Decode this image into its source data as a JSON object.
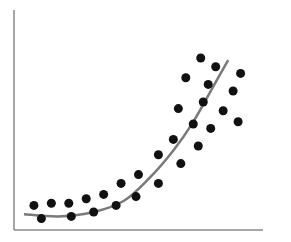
{
  "chart_data": {
    "type": "scatter",
    "title": "",
    "xlabel": "",
    "ylabel": "",
    "grid": false,
    "legend": null,
    "xlim": [
      0,
      100
    ],
    "ylim": [
      0,
      100
    ],
    "points": [
      {
        "x": 8,
        "y": 8
      },
      {
        "x": 11,
        "y": 2
      },
      {
        "x": 15,
        "y": 9
      },
      {
        "x": 22,
        "y": 9
      },
      {
        "x": 23,
        "y": 3
      },
      {
        "x": 29,
        "y": 11
      },
      {
        "x": 32,
        "y": 5
      },
      {
        "x": 36,
        "y": 13
      },
      {
        "x": 41,
        "y": 8
      },
      {
        "x": 43,
        "y": 18
      },
      {
        "x": 49,
        "y": 12
      },
      {
        "x": 50,
        "y": 22
      },
      {
        "x": 58,
        "y": 18
      },
      {
        "x": 58,
        "y": 31
      },
      {
        "x": 64,
        "y": 38
      },
      {
        "x": 67,
        "y": 27
      },
      {
        "x": 66,
        "y": 52
      },
      {
        "x": 74,
        "y": 35
      },
      {
        "x": 72,
        "y": 45
      },
      {
        "x": 79,
        "y": 43
      },
      {
        "x": 76,
        "y": 55
      },
      {
        "x": 84,
        "y": 51
      },
      {
        "x": 69,
        "y": 66
      },
      {
        "x": 78,
        "y": 63
      },
      {
        "x": 75,
        "y": 75
      },
      {
        "x": 81,
        "y": 71
      },
      {
        "x": 91,
        "y": 68
      },
      {
        "x": 88,
        "y": 60
      },
      {
        "x": 90,
        "y": 46
      }
    ],
    "trendline": {
      "type": "exponential",
      "points": [
        {
          "x": 4,
          "y": 4
        },
        {
          "x": 18,
          "y": 3
        },
        {
          "x": 32,
          "y": 5
        },
        {
          "x": 44,
          "y": 10
        },
        {
          "x": 54,
          "y": 20
        },
        {
          "x": 64,
          "y": 33
        },
        {
          "x": 72,
          "y": 46
        },
        {
          "x": 80,
          "y": 62
        },
        {
          "x": 86,
          "y": 74
        }
      ],
      "color": "#7a7a7a"
    },
    "colors": {
      "points": "#111111",
      "axes": "#8a8a8a",
      "trend": "#7a7a7a"
    }
  }
}
